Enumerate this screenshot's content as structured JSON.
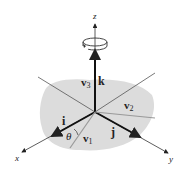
{
  "diagram": {
    "type": "3d-coordinate-axes-rotation",
    "axes": {
      "x": "x",
      "y": "y",
      "z": "z"
    },
    "unit_vectors": {
      "i": "i",
      "j": "j",
      "k": "k"
    },
    "vectors": {
      "v1": {
        "base": "v",
        "sub": "1"
      },
      "v2": {
        "base": "v",
        "sub": "2"
      },
      "v3": {
        "base": "v",
        "sub": "3"
      }
    },
    "angle": "θ",
    "rotation_symbol": "rotation-arrow-about-z",
    "colors": {
      "plane": "#dcdcdc",
      "axis": "#333333",
      "unit_vector": "#111111",
      "rotated_vector": "#9a9a9a"
    }
  }
}
